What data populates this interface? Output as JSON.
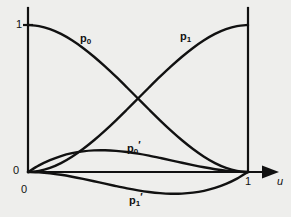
{
  "figure": {
    "background_color": "#eeeeec",
    "line_color": "#111111",
    "axis_label_x": "u",
    "tick_y_one": "1",
    "tick_y_zero": "0",
    "tick_x_zero": "0",
    "tick_x_one": "1"
  },
  "labels": {
    "p0": "p",
    "p0_sub": "0",
    "p1": "p",
    "p1_sub": "1",
    "p0_prime": "p",
    "p0_prime_sub": "0",
    "p0_prime_mark": "′",
    "p1_prime": "p",
    "p1_prime_sub": "1",
    "p1_prime_mark": "′"
  },
  "chart_data": {
    "type": "line",
    "title": "",
    "xlabel": "u",
    "ylabel": "",
    "xlim": [
      0,
      1
    ],
    "ylim": [
      -0.2,
      1.05
    ],
    "grid": false,
    "legend": "inline-annotations",
    "x": [
      0,
      0.05,
      0.1,
      0.15,
      0.2,
      0.25,
      0.3,
      0.35,
      0.4,
      0.45,
      0.5,
      0.55,
      0.6,
      0.65,
      0.7,
      0.75,
      0.8,
      0.85,
      0.9,
      0.95,
      1
    ],
    "series": [
      {
        "name": "p0",
        "label": "p₀",
        "annotation_at": [
          0.3,
          0.83
        ],
        "formula": "2u^3 - 3u^2 + 1",
        "values": [
          1,
          0.9928,
          0.972,
          0.9393,
          0.896,
          0.8438,
          0.784,
          0.7183,
          0.648,
          0.5748,
          0.5,
          0.4253,
          0.352,
          0.2818,
          0.216,
          0.1563,
          0.104,
          0.0607,
          0.028,
          0.0073,
          0
        ]
      },
      {
        "name": "p1",
        "label": "p₁",
        "annotation_at": [
          0.71,
          0.86
        ],
        "formula": "-2u^3 + 3u^2",
        "values": [
          0,
          0.0073,
          0.028,
          0.0607,
          0.104,
          0.1563,
          0.216,
          0.2818,
          0.352,
          0.4253,
          0.5,
          0.5748,
          0.648,
          0.7183,
          0.784,
          0.8438,
          0.896,
          0.9393,
          0.972,
          0.9928,
          1
        ]
      },
      {
        "name": "p0_prime",
        "label": "p₀′",
        "annotation_at": [
          0.47,
          0.2
        ],
        "formula": "u^3 - 2u^2 + u",
        "values": [
          0,
          0.0451,
          0.081,
          0.1084,
          0.128,
          0.1406,
          0.147,
          0.1479,
          0.144,
          0.1361,
          0.125,
          0.1114,
          0.096,
          0.0796,
          0.063,
          0.0469,
          0.032,
          0.0191,
          0.009,
          0.0024,
          0
        ]
      },
      {
        "name": "p1_prime",
        "label": "p₁′",
        "annotation_at": [
          0.47,
          -0.12
        ],
        "formula": "u^3 - u^2",
        "values": [
          0,
          -0.0024,
          -0.009,
          -0.0191,
          -0.032,
          -0.0469,
          -0.063,
          -0.0796,
          -0.096,
          -0.1114,
          -0.125,
          -0.1361,
          -0.144,
          -0.1479,
          -0.147,
          -0.1406,
          -0.128,
          -0.1084,
          -0.081,
          -0.0451,
          0
        ]
      }
    ],
    "axes": {
      "y_axis_x_position": 0,
      "right_vertical_line_x": 1,
      "x_axis_y_position": 0,
      "x_axis_has_arrow": true,
      "y_axis_top_value": 1.05
    }
  }
}
